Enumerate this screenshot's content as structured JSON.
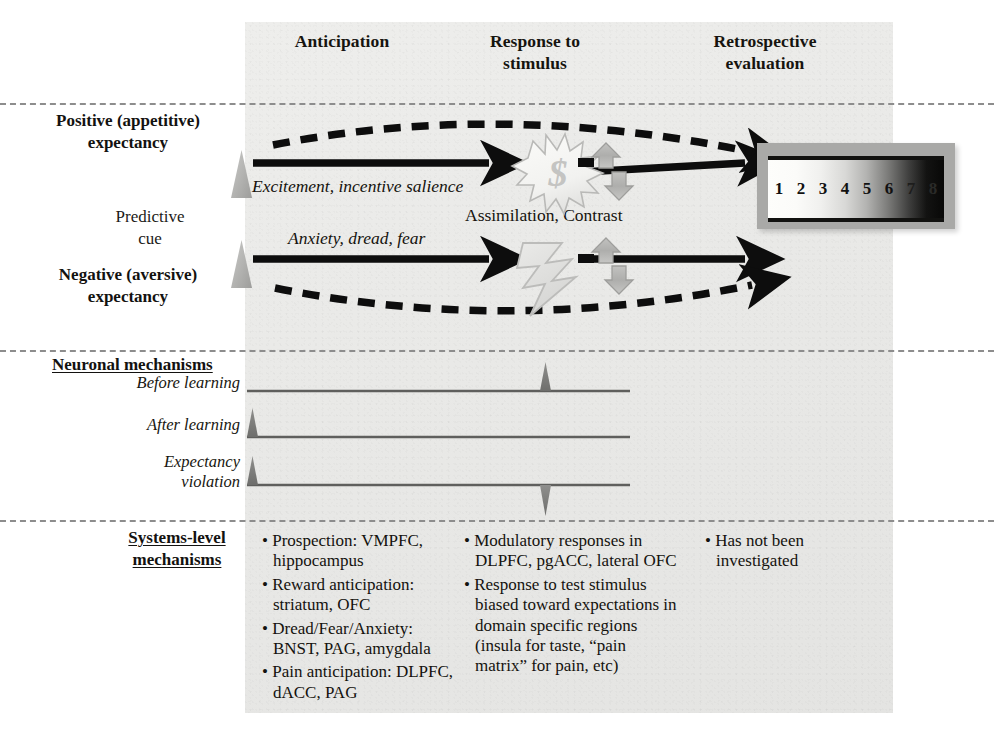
{
  "headers": {
    "anticipation": "Anticipation",
    "response": "Response to stimulus",
    "response_line1": "Response to",
    "response_line2": "stimulus",
    "retrospective": "Retrospective evaluation",
    "retro_line1": "Retrospective",
    "retro_line2": "evaluation"
  },
  "rows": {
    "positive": "Positive (appetitive) expectancy",
    "positive_line1": "Positive (appetitive)",
    "positive_line2": "expectancy",
    "negative": "Negative (aversive) expectancy",
    "negative_line1": "Negative (aversive)",
    "negative_line2": "expectancy",
    "cue": "Predictive cue",
    "cue_line1": "Predictive",
    "cue_line2": "cue"
  },
  "captions": {
    "excitement": "Excitement, incentive salience",
    "anxiety": "Anxiety, dread, fear",
    "assimilation": "Assimilation, Contrast"
  },
  "icons": {
    "reward": "dollar-sign-starburst",
    "aversive": "lightning-bolt",
    "modulation": "up-down-double-arrow",
    "cue_marker": "gray-triangle"
  },
  "rating_scale": {
    "label": "retrospective-evaluation-rating-scale",
    "ticks": [
      "1",
      "2",
      "3",
      "4",
      "5",
      "6",
      "7",
      "8"
    ],
    "gradient_from": "#fdfdfb",
    "gradient_to": "#080807"
  },
  "neuronal": {
    "heading": "Neuronal mechanisms",
    "traces": [
      {
        "label": "Before learning",
        "label_line1": "Before learning",
        "label_line2": "",
        "cue_spike": false,
        "stim_spike": "up"
      },
      {
        "label": "After learning",
        "label_line1": "After learning",
        "label_line2": "",
        "cue_spike": true,
        "stim_spike": "none"
      },
      {
        "label": "Expectancy violation",
        "label_line1": "Expectancy",
        "label_line2": "violation",
        "cue_spike": true,
        "stim_spike": "down"
      }
    ]
  },
  "systems": {
    "heading": "Systems-level mechanisms",
    "heading_line1": "Systems-level",
    "heading_line2": "mechanisms",
    "columns": [
      {
        "column": "anticipation",
        "bullets": [
          "Prospection: VMPFC, hippocampus",
          "Reward anticipation: striatum, OFC",
          "Dread/Fear/Anxiety: BNST, PAG, amygdala",
          "Pain anticipation: DLPFC, dACC, PAG"
        ]
      },
      {
        "column": "response-to-stimulus",
        "bullets": [
          "Modulatory responses in DLPFC, pgACC, lateral OFC",
          "Response to test stimulus biased toward expectations in domain specific regions (insula for taste, “pain matrix” for pain, etc)"
        ]
      },
      {
        "column": "retrospective-evaluation",
        "bullets": [
          "Has not been investigated"
        ]
      }
    ]
  },
  "colors": {
    "panel": "#e9e9e7",
    "arrow": "#101010",
    "gray_icon": "#b8b8b6",
    "dashed_rule": "#8d8d8d"
  }
}
